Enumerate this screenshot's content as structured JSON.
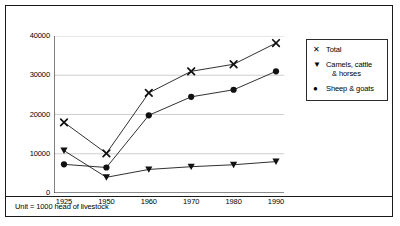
{
  "footer": {
    "note": "Unit = 1000 head of livestock"
  },
  "legend": {
    "position": "right",
    "entries": [
      {
        "marker": "x-marker-icon",
        "glyph": "✕",
        "label": "Total"
      },
      {
        "marker": "triangle-down-marker-icon",
        "glyph": "▼",
        "label": "Camels, cattle",
        "label2": "& horses"
      },
      {
        "marker": "circle-marker-icon",
        "glyph": "●",
        "label": "Sheep & goats"
      }
    ]
  },
  "chart_data": {
    "type": "line",
    "title": "",
    "xlabel": "",
    "ylabel": "",
    "categories": [
      "1925",
      "1950",
      "1960",
      "1970",
      "1980",
      "1990"
    ],
    "yticks": [
      "0",
      "10000",
      "20000",
      "30000",
      "40000"
    ],
    "ylim": [
      0,
      40000
    ],
    "grid": true,
    "unit": "1000 head of livestock",
    "series": [
      {
        "name": "Total",
        "marker": "x",
        "values": [
          18000,
          10100,
          25500,
          31000,
          32800,
          38200
        ]
      },
      {
        "name": "Camels, cattle & horses",
        "marker": "triangle-down",
        "values": [
          10800,
          4000,
          6000,
          6700,
          7200,
          8000
        ]
      },
      {
        "name": "Sheep & goats",
        "marker": "circle",
        "values": [
          7300,
          6500,
          19800,
          24500,
          26300,
          31000
        ]
      }
    ]
  }
}
